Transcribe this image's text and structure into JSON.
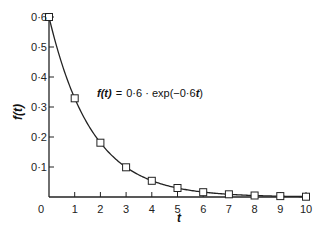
{
  "chart_data": {
    "type": "line",
    "title": "",
    "annotation": "f(t) = 0·6 · exp(−0·6t)",
    "annotation_parts": {
      "lhs": "f(t)",
      "eq": "=",
      "rhs": "0·6 · exp(−0·6",
      "var": "t",
      "close": ")"
    },
    "xlabel": "t",
    "ylabel": "f(t)",
    "xlim": [
      0,
      10
    ],
    "ylim": [
      0,
      0.6
    ],
    "grid": false,
    "legend": "none",
    "x_ticks": [
      0,
      1,
      2,
      3,
      4,
      5,
      6,
      7,
      8,
      9,
      10
    ],
    "x_tick_labels": [
      "0",
      "1",
      "2",
      "3",
      "4",
      "5",
      "6",
      "7",
      "8",
      "9",
      "10"
    ],
    "y_ticks": [
      0.1,
      0.2,
      0.3,
      0.4,
      0.5,
      0.6
    ],
    "y_tick_labels": [
      "0·1",
      "0·2",
      "0·3",
      "0·4",
      "0·5",
      "0·6"
    ],
    "series": [
      {
        "name": "f(t) = 0.6·exp(-0.6t)",
        "marker": "square",
        "x": [
          0,
          1,
          2,
          3,
          4,
          5,
          6,
          7,
          8,
          9,
          10
        ],
        "values": [
          0.6,
          0.329,
          0.181,
          0.099,
          0.054,
          0.03,
          0.016,
          0.009,
          0.005,
          0.003,
          0.001
        ]
      }
    ]
  },
  "layout": {
    "origin_px": [
      49,
      197
    ],
    "x_px_per_unit": 25.7,
    "y_px_per_unit": 300
  }
}
